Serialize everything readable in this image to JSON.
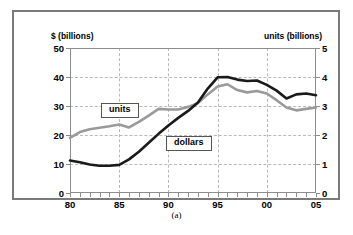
{
  "figure": {
    "caption": "(a)",
    "left_axis_title": "$ (billions)",
    "right_axis_title": "units (billions)"
  },
  "chart_data": {
    "type": "line",
    "title": "",
    "xlabel": "",
    "ylabel": "$ (billions)",
    "y2label": "units (billions)",
    "xlim": [
      80,
      105
    ],
    "ylim": [
      0,
      50
    ],
    "y2lim": [
      0,
      5
    ],
    "grid": true,
    "legend": "inline-labels",
    "x_tick_labels": [
      "80",
      "85",
      "90",
      "95",
      "00",
      "05"
    ],
    "x_tick_values": [
      80,
      85,
      90,
      95,
      100,
      105
    ],
    "x_minor_tick_values": [
      80,
      81,
      82,
      83,
      84,
      85,
      86,
      87,
      88,
      89,
      90,
      91,
      92,
      93,
      94,
      95,
      96,
      97,
      98,
      99,
      100,
      101,
      102,
      103,
      104,
      105
    ],
    "y_tick_labels": [
      "0",
      "10",
      "20",
      "30",
      "40",
      "50"
    ],
    "y_tick_values": [
      0,
      10,
      20,
      30,
      40,
      50
    ],
    "y2_tick_labels": [
      "0",
      "1",
      "2",
      "3",
      "4",
      "5"
    ],
    "y2_tick_values": [
      0,
      1,
      2,
      3,
      4,
      5
    ],
    "x": [
      80,
      81,
      82,
      83,
      84,
      85,
      86,
      87,
      88,
      89,
      90,
      91,
      92,
      93,
      94,
      95,
      96,
      97,
      98,
      99,
      100,
      101,
      102,
      103,
      104,
      105
    ],
    "series": [
      {
        "name": "dollars",
        "axis": "left",
        "color": "#1a1a1a",
        "label_text": "dollars",
        "values": [
          11.2,
          10.6,
          9.8,
          9.4,
          9.4,
          9.7,
          11.6,
          14.2,
          17.3,
          20.4,
          23.3,
          25.9,
          28.3,
          31.2,
          36.0,
          39.9,
          40.0,
          39.1,
          38.6,
          38.8,
          37.3,
          35.3,
          32.6,
          34.0,
          34.3,
          33.7
        ]
      },
      {
        "name": "units",
        "axis": "right",
        "color": "#9a9a9a",
        "label_text": "units",
        "values": [
          1.9,
          2.1,
          2.2,
          2.25,
          2.3,
          2.36,
          2.26,
          2.45,
          2.67,
          2.9,
          2.88,
          2.88,
          2.97,
          3.1,
          3.4,
          3.67,
          3.75,
          3.55,
          3.47,
          3.52,
          3.43,
          3.2,
          2.95,
          2.85,
          2.9,
          2.95
        ]
      }
    ]
  }
}
